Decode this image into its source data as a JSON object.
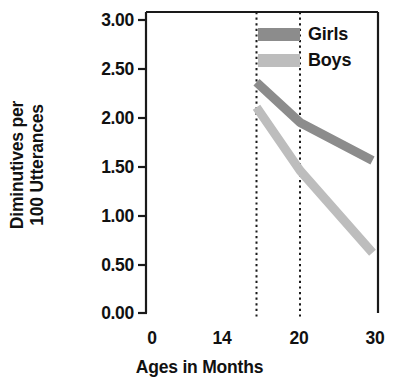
{
  "chart_data": {
    "type": "line",
    "title": "",
    "xlabel": "Ages in Months",
    "ylabel": "Diminutives per 100 Utterances",
    "ylabel_lines": [
      "Diminutives per",
      "100 Utterances"
    ],
    "x": [
      14,
      20,
      30
    ],
    "xlim": [
      0,
      32
    ],
    "ylim": [
      0,
      3.0
    ],
    "xticks": [
      0,
      14,
      20,
      30
    ],
    "xtick_labels": [
      "0",
      "14",
      "20",
      "30"
    ],
    "yticks": [
      0.0,
      0.5,
      1.0,
      1.5,
      2.0,
      2.5,
      3.0
    ],
    "ytick_labels": [
      "0.00",
      "0.50",
      "1.00",
      "1.50",
      "2.00",
      "2.50",
      "3.00"
    ],
    "grid": false,
    "legend_position": "top-right",
    "reference_lines": [
      {
        "x": 14,
        "style": "dotted"
      },
      {
        "x": 20,
        "style": "dotted"
      }
    ],
    "series": [
      {
        "name": "Girls",
        "color": "#8c8c8c",
        "values": [
          2.3,
          1.9,
          1.52
        ]
      },
      {
        "name": "Boys",
        "color": "#bdbdbd",
        "values": [
          2.05,
          1.42,
          0.6
        ]
      }
    ]
  },
  "axes": {
    "ylabel_line1": "Diminutives per",
    "ylabel_line2": "100 Utterances",
    "xlabel": "Ages in Months",
    "ytick_0": "0.00",
    "ytick_1": "0.50",
    "ytick_2": "1.00",
    "ytick_3": "1.50",
    "ytick_4": "2.00",
    "ytick_5": "2.50",
    "ytick_6": "3.00",
    "xtick_0": "0",
    "xtick_1": "14",
    "xtick_2": "20",
    "xtick_3": "30"
  },
  "legend": {
    "items": [
      {
        "label": "Girls",
        "color": "#8c8c8c"
      },
      {
        "label": "Boys",
        "color": "#bdbdbd"
      }
    ]
  },
  "colors": {
    "girls": "#8c8c8c",
    "boys": "#bdbdbd",
    "axis": "#1a1a1a",
    "background": "#ffffff"
  }
}
